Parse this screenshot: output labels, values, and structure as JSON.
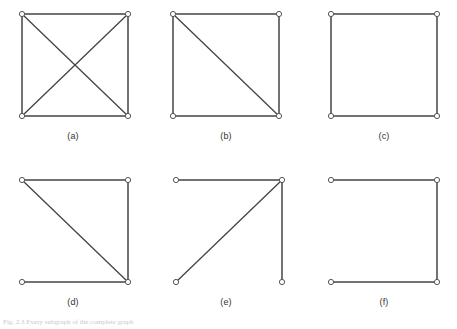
{
  "figure": {
    "background_color": "#ffffff",
    "edge_color": "#444444",
    "node_stroke_color": "#555555",
    "node_fill_color": "#ffffff",
    "caption_text": "Fig. 2.3 Every subgraph of the complete graph",
    "caption_number": "Fig. 2.3",
    "panels": [
      {
        "id": "a",
        "label": "(a)",
        "x": 16,
        "y": 6,
        "width": 118,
        "height": 118,
        "nodes": [
          {
            "name": "top-left",
            "cx": 6,
            "cy": 8
          },
          {
            "name": "top-right",
            "cx": 112,
            "cy": 8
          },
          {
            "name": "bottom-left",
            "cx": 6,
            "cy": 110
          },
          {
            "name": "bottom-right",
            "cx": 112,
            "cy": 110
          }
        ],
        "edges": [
          {
            "from": "top-left",
            "to": "top-right",
            "kind": "side"
          },
          {
            "from": "top-left",
            "to": "bottom-left",
            "kind": "side"
          },
          {
            "from": "top-right",
            "to": "bottom-right",
            "kind": "side"
          },
          {
            "from": "bottom-left",
            "to": "bottom-right",
            "kind": "side"
          },
          {
            "from": "top-left",
            "to": "bottom-right",
            "kind": "diagonal"
          },
          {
            "from": "top-right",
            "to": "bottom-left",
            "kind": "diagonal"
          }
        ]
      },
      {
        "id": "b",
        "label": "(b)",
        "x": 167,
        "y": 6,
        "width": 118,
        "height": 118,
        "nodes": [
          {
            "name": "top-left",
            "cx": 6,
            "cy": 8
          },
          {
            "name": "top-right",
            "cx": 112,
            "cy": 8
          },
          {
            "name": "bottom-left",
            "cx": 6,
            "cy": 110
          },
          {
            "name": "bottom-right",
            "cx": 112,
            "cy": 110
          }
        ],
        "edges": [
          {
            "from": "top-left",
            "to": "top-right",
            "kind": "side"
          },
          {
            "from": "top-left",
            "to": "bottom-left",
            "kind": "side"
          },
          {
            "from": "top-right",
            "to": "bottom-right",
            "kind": "side"
          },
          {
            "from": "bottom-left",
            "to": "bottom-right",
            "kind": "side"
          },
          {
            "from": "top-left",
            "to": "bottom-right",
            "kind": "diagonal"
          }
        ]
      },
      {
        "id": "c",
        "label": "(c)",
        "x": 325,
        "y": 6,
        "width": 118,
        "height": 118,
        "nodes": [
          {
            "name": "top-left",
            "cx": 6,
            "cy": 8
          },
          {
            "name": "top-right",
            "cx": 112,
            "cy": 8
          },
          {
            "name": "bottom-left",
            "cx": 6,
            "cy": 110
          },
          {
            "name": "bottom-right",
            "cx": 112,
            "cy": 110
          }
        ],
        "edges": [
          {
            "from": "top-left",
            "to": "top-right",
            "kind": "side"
          },
          {
            "from": "top-left",
            "to": "bottom-left",
            "kind": "side"
          },
          {
            "from": "top-right",
            "to": "bottom-right",
            "kind": "side"
          },
          {
            "from": "bottom-left",
            "to": "bottom-right",
            "kind": "side"
          }
        ]
      },
      {
        "id": "d",
        "label": "(d)",
        "x": 16,
        "y": 172,
        "width": 118,
        "height": 118,
        "nodes": [
          {
            "name": "top-left",
            "cx": 6,
            "cy": 8
          },
          {
            "name": "top-right",
            "cx": 112,
            "cy": 8
          },
          {
            "name": "bottom-left",
            "cx": 6,
            "cy": 110
          },
          {
            "name": "bottom-right",
            "cx": 112,
            "cy": 110
          }
        ],
        "edges": [
          {
            "from": "top-left",
            "to": "top-right",
            "kind": "side"
          },
          {
            "from": "top-right",
            "to": "bottom-right",
            "kind": "side"
          },
          {
            "from": "bottom-left",
            "to": "bottom-right",
            "kind": "side"
          },
          {
            "from": "top-left",
            "to": "bottom-right",
            "kind": "diagonal"
          }
        ]
      },
      {
        "id": "e",
        "label": "(e)",
        "x": 170,
        "y": 172,
        "width": 118,
        "height": 118,
        "nodes": [
          {
            "name": "top-left",
            "cx": 6,
            "cy": 8
          },
          {
            "name": "top-right",
            "cx": 112,
            "cy": 8
          },
          {
            "name": "bottom-left",
            "cx": 6,
            "cy": 110
          },
          {
            "name": "bottom-right",
            "cx": 112,
            "cy": 110
          }
        ],
        "edges": [
          {
            "from": "top-left",
            "to": "top-right",
            "kind": "side"
          },
          {
            "from": "top-right",
            "to": "bottom-right",
            "kind": "side"
          },
          {
            "from": "bottom-left",
            "to": "top-right",
            "kind": "diagonal"
          }
        ]
      },
      {
        "id": "f",
        "label": "(f)",
        "x": 325,
        "y": 172,
        "width": 118,
        "height": 118,
        "nodes": [
          {
            "name": "top-left",
            "cx": 6,
            "cy": 8
          },
          {
            "name": "top-right",
            "cx": 112,
            "cy": 8
          },
          {
            "name": "bottom-left",
            "cx": 6,
            "cy": 110
          },
          {
            "name": "bottom-right",
            "cx": 112,
            "cy": 110
          }
        ],
        "edges": [
          {
            "from": "top-left",
            "to": "top-right",
            "kind": "side"
          },
          {
            "from": "top-right",
            "to": "bottom-right",
            "kind": "side"
          },
          {
            "from": "bottom-left",
            "to": "bottom-right",
            "kind": "side"
          }
        ]
      }
    ],
    "caption_positions": [
      {
        "id": "a",
        "x": 43,
        "y": 131
      },
      {
        "id": "b",
        "x": 196,
        "y": 131
      },
      {
        "id": "c",
        "x": 354,
        "y": 131
      },
      {
        "id": "d",
        "x": 43,
        "y": 297
      },
      {
        "id": "e",
        "x": 196,
        "y": 297
      },
      {
        "id": "f",
        "x": 354,
        "y": 297
      }
    ]
  }
}
